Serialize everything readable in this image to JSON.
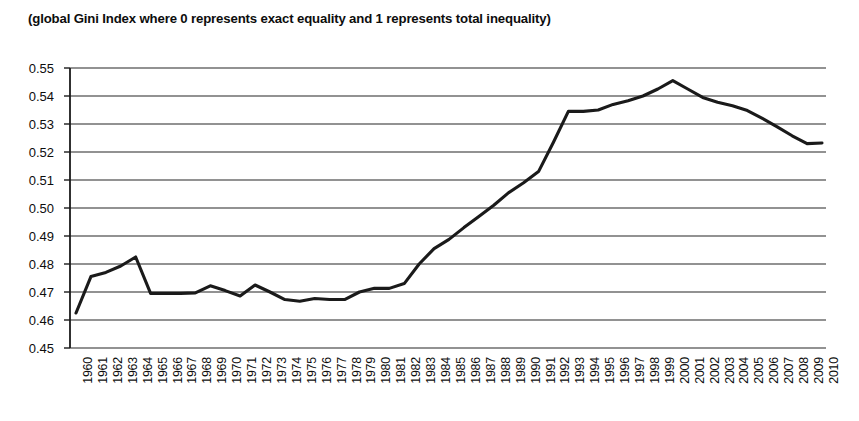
{
  "chart_data": {
    "type": "line",
    "title": "(global Gini Index where 0 represents exact equality and 1 represents total inequality)",
    "xlabel": "",
    "ylabel": "",
    "ylim": [
      0.45,
      0.55
    ],
    "ytick_step": 0.01,
    "grid": true,
    "legend": "none",
    "line_color": "#1a1a1a",
    "grid_color": "#6e6e6e",
    "axis_color": "#1a1a1a",
    "ytick_labels": [
      "0.55",
      "0.54",
      "0.53",
      "0.52",
      "0.51",
      "0.50",
      "0.49",
      "0.48",
      "0.47",
      "0.46",
      "0.45"
    ],
    "ytick_values": [
      0.55,
      0.54,
      0.53,
      0.52,
      0.51,
      0.5,
      0.49,
      0.48,
      0.47,
      0.46,
      0.45
    ],
    "categories": [
      "1960",
      "1961",
      "1962",
      "1963",
      "1964",
      "1965",
      "1966",
      "1967",
      "1968",
      "1969",
      "1970",
      "1971",
      "1972",
      "1973",
      "1974",
      "1975",
      "1976",
      "1977",
      "1978",
      "1979",
      "1980",
      "1981",
      "1982",
      "1983",
      "1984",
      "1985",
      "1986",
      "1987",
      "1988",
      "1989",
      "1990",
      "1991",
      "1992",
      "1993",
      "1994",
      "1995",
      "1996",
      "1997",
      "1998",
      "1999",
      "2000",
      "2001",
      "2002",
      "2003",
      "2004",
      "2005",
      "2006",
      "2007",
      "2008",
      "2009",
      "2010"
    ],
    "values": [
      0.4625,
      0.4755,
      0.477,
      0.4793,
      0.4825,
      0.4695,
      0.4695,
      0.4695,
      0.4697,
      0.4722,
      0.4705,
      0.4686,
      0.4725,
      0.47,
      0.4673,
      0.4667,
      0.4677,
      0.4673,
      0.4673,
      0.47,
      0.4713,
      0.4713,
      0.473,
      0.48,
      0.4855,
      0.4888,
      0.493,
      0.497,
      0.501,
      0.5055,
      0.509,
      0.513,
      0.5235,
      0.5345,
      0.5345,
      0.535,
      0.537,
      0.5383,
      0.54,
      0.5425,
      0.5455,
      0.5425,
      0.5395,
      0.5378,
      0.5365,
      0.5348,
      0.532,
      0.529,
      0.5258,
      0.523,
      0.5232
    ]
  }
}
